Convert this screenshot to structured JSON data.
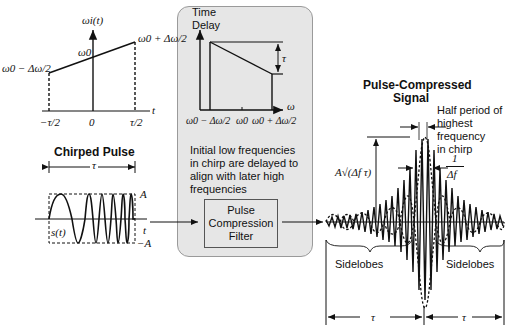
{
  "diagram": {
    "freq_plot": {
      "y_label": "ωi(t)",
      "x_label": "t",
      "y_low": "ω0 − Δω/2",
      "y_mid": "ω0",
      "y_high": "ω0 + Δω/2",
      "x_ticks": [
        "−τ/2",
        "0",
        "τ/2"
      ]
    },
    "delay_panel": {
      "y_label_line1": "Time",
      "y_label_line2": "Delay",
      "x_label": "ω",
      "delta_label": "τ",
      "x_ticks": [
        "ω0 − Δω/2",
        "ω0",
        "ω0 + Δω/2"
      ],
      "caption": "Initial low frequencies in chirp are delayed to align with later high frequencies",
      "filter_label_1": "Pulse",
      "filter_label_2": "Compression",
      "filter_label_3": "Filter"
    },
    "chirped_pulse": {
      "title": "Chirped Pulse",
      "width_label": "τ",
      "amp_pos": "A",
      "amp_neg": "−A",
      "signal_label": "s(t)",
      "x_label": "t"
    },
    "compressed": {
      "title_line1": "Pulse-Compressed",
      "title_line2": "Signal",
      "half_period_note": [
        "Half period of",
        "highest",
        "frequency",
        "in chirp"
      ],
      "width_num": "1",
      "width_den": "Δf",
      "peak_label": "A√(Δf τ)",
      "sidelobes_left": "Sidelobes",
      "sidelobes_right": "Sidelobes",
      "span_left": "τ",
      "span_right": "τ"
    },
    "colors": {
      "panel_bg": "#e6e6e6",
      "panel_border": "#9a9a9a",
      "line": "#111111"
    }
  }
}
